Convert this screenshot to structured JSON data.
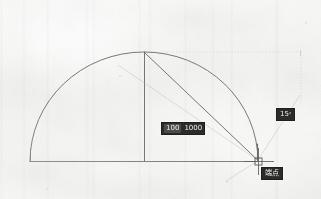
{
  "app": {
    "kind": "cad-drawing-scan",
    "background_color": "#f5f5f3",
    "ink_color": "#6e6e6e",
    "tooltip_bg_color": "#1b1b1b",
    "tooltip_text_color": "#f2f2f2"
  },
  "drawing": {
    "title": "Semicircle with radius and polar tracking",
    "geometry": {
      "arc": {
        "name": "semicircular-arc",
        "center_x": 144,
        "center_y": 161,
        "radius": 114,
        "start_angle_deg": 180,
        "end_angle_deg": 0
      },
      "baseline": {
        "name": "diameter-baseline",
        "x1": 30,
        "y1": 161,
        "x2": 258,
        "y2": 161
      },
      "vertical_radius": {
        "name": "vertical-radius-line",
        "x1": 144,
        "y1": 52,
        "x2": 144,
        "y2": 161
      },
      "chord": {
        "name": "chord-to-cursor",
        "x1": 144,
        "y1": 52,
        "x2": 258,
        "y2": 161
      },
      "left_riser": {
        "name": "left-vertical-riser",
        "x1": 30,
        "y1": 150,
        "x2": 30,
        "y2": 161
      }
    },
    "tracking": {
      "horizontal_dotted": {
        "name": "horizontal-polar-tracking-line",
        "x1": 144,
        "y1": 52,
        "x2": 301,
        "y2": 52
      },
      "vertical_dotted": {
        "name": "vertical-polar-tracking-line",
        "x1": 301,
        "y1": 52,
        "x2": 301,
        "y2": 104
      },
      "diagonal_a": {
        "name": "diagonal-tracking-line-upper",
        "x1": 258,
        "y1": 161,
        "x2": 299,
        "y2": 96
      },
      "diagonal_b": {
        "name": "diagonal-tracking-line-lower",
        "x1": 258,
        "y1": 161,
        "x2": 120,
        "y2": 66
      },
      "diagonal_c": {
        "name": "diagonal-tracking-line-tail",
        "x1": 258,
        "y1": 161,
        "x2": 228,
        "y2": 180
      }
    },
    "cursor": {
      "name": "crosshair-cursor",
      "x": 258,
      "y": 161,
      "pick_box_size": 7,
      "crosshair_arm": 14
    }
  },
  "tooltips": {
    "dimension": {
      "name": "dimension-input-tooltip",
      "field_a": "100",
      "field_b": "1000"
    },
    "angle": {
      "name": "angle-input-tooltip",
      "value": "15",
      "unit": "°"
    },
    "osnap": {
      "name": "object-snap-tooltip",
      "label": "端点"
    }
  }
}
